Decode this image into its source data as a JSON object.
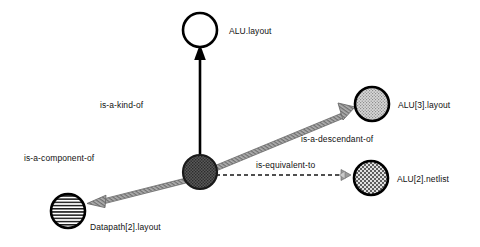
{
  "diagram": {
    "background_color": "#ffffff",
    "nodes": [
      {
        "id": "alu-layout",
        "label": "ALU.layout",
        "fill_style": "empty",
        "fill_color": "#ffffff",
        "stroke_color": "#000000",
        "cx": 200,
        "cy": 30,
        "r": 17,
        "label_x": 229,
        "label_y": 26
      },
      {
        "id": "alu2-instance",
        "label": "",
        "fill_style": "dense-dark-stipple",
        "fill_color": "#4a4a4a",
        "stroke_color": "#000000",
        "cx": 200,
        "cy": 172,
        "r": 17,
        "label_x": 0,
        "label_y": 0
      },
      {
        "id": "alu3-layout",
        "label": "ALU[3].layout",
        "fill_style": "light-stipple",
        "fill_color": "#b8b8b8",
        "stroke_color": "#000000",
        "cx": 372,
        "cy": 104,
        "r": 17,
        "label_x": 398,
        "label_y": 100
      },
      {
        "id": "alu2-netlist",
        "label": "ALU[2].netlist",
        "fill_style": "checker",
        "fill_color": "#9a9a9a",
        "stroke_color": "#000000",
        "cx": 371,
        "cy": 178,
        "r": 17,
        "label_x": 397,
        "label_y": 174
      },
      {
        "id": "datapath2-layout",
        "label": "Datapath[2].layout",
        "fill_style": "horizontal-stripes",
        "fill_color": "#ffffff",
        "stroke_color": "#000000",
        "cx": 68,
        "cy": 211,
        "r": 17,
        "label_x": 90,
        "label_y": 222
      }
    ],
    "edges": [
      {
        "id": "is-a-kind-of",
        "label": "is-a-kind-of",
        "from": "alu2-instance",
        "to": "alu-layout",
        "style": "solid",
        "color": "#000000",
        "label_x": 100,
        "label_y": 100
      },
      {
        "id": "is-a-component-of",
        "label": "is-a-component-of",
        "from": "alu2-instance",
        "to": "datapath2-layout",
        "style": "tapered",
        "color": "#8a8a8a",
        "label_x": 24,
        "label_y": 153
      },
      {
        "id": "is-a-descendant-of",
        "label": "is-a-descendant-of",
        "from": "alu2-instance",
        "to": "alu3-layout",
        "style": "tapered",
        "color": "#8a8a8a",
        "label_x": 301,
        "label_y": 134
      },
      {
        "id": "is-equivalent-to",
        "label": "is-equivalent-to",
        "from": "alu2-instance",
        "to": "alu2-netlist",
        "style": "dashed",
        "color": "#555555",
        "label_x": 256,
        "label_y": 160
      }
    ]
  }
}
